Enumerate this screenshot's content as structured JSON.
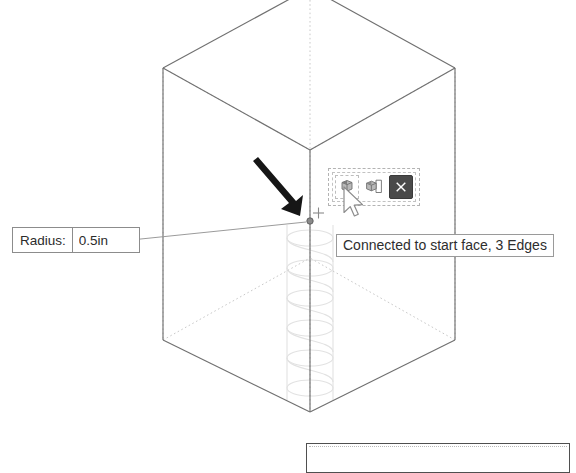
{
  "app": {
    "view_mode": "3D Isometric Wireframe Viewport",
    "background_color": "#ffffff"
  },
  "radius_callout": {
    "name": "Radius input callout",
    "label": "Radius:",
    "value": "0.5in",
    "placeholder": "0.0in",
    "border_color": "#8c8c8c",
    "text_color": "#2b2b2b"
  },
  "tooltip": {
    "text": "Connected to start face, 3 Edges",
    "border_color": "#9a9a9a",
    "text_color": "#2e2e2e"
  },
  "mini_toolbar": {
    "name": "Floating mini toolbar",
    "buttons": [
      {
        "icon": "select-face-cube-icon",
        "label": "Select Face",
        "state": "active"
      },
      {
        "icon": "extrude-box-icon",
        "label": "Extrude Profile",
        "state": "normal"
      },
      {
        "icon": "close-x-icon",
        "label": "Close",
        "state": "close"
      }
    ],
    "close_button_color": "#4a4a4a",
    "selection_border_color": "#b3b3b3"
  },
  "cursor": {
    "icon": "mouse-pointer-icon",
    "x": 343,
    "y": 186
  },
  "annotation_arrow": {
    "icon": "pointer-arrow-icon",
    "color": "#1a1a1a",
    "from_x": 259,
    "from_y": 158,
    "to_x": 311,
    "to_y": 219
  },
  "geometry": {
    "name": "Isometric box with internal helix",
    "edge_color": "#6e6e6e",
    "hidden_edge_color": "#c4c4c4",
    "helix_color": "#dcdcdc",
    "snap_point": {
      "x": 310,
      "y": 221,
      "marker": "snap-point-marker"
    },
    "crosshair": {
      "x": 318,
      "y": 213,
      "marker": "crosshair-marker"
    },
    "box": {
      "top_apex": {
        "x": 310,
        "y": -10
      },
      "top_left": {
        "x": 163,
        "y": 68
      },
      "top_right": {
        "x": 455,
        "y": 68
      },
      "top_center_front": {
        "x": 310,
        "y": 150
      },
      "bottom_left": {
        "x": 163,
        "y": 340
      },
      "bottom_right": {
        "x": 455,
        "y": 340
      },
      "bottom_apex": {
        "x": 310,
        "y": 412
      },
      "bottom_back": {
        "x": 310,
        "y": 258
      }
    }
  }
}
